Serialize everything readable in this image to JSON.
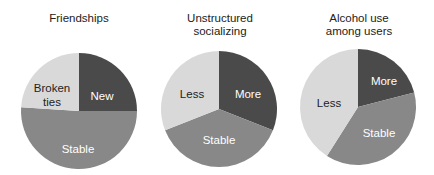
{
  "chart_data": [
    {
      "type": "pie",
      "title": "Friendships",
      "slices": [
        {
          "label": "New",
          "value": 25,
          "color": "#4a4a4a",
          "text_color": "#ffffff"
        },
        {
          "label": "Stable",
          "value": 51,
          "color": "#888888",
          "text_color": "#ffffff"
        },
        {
          "label": "Broken ties",
          "value": 24,
          "color": "#d9d9d9",
          "text_color": "#222222"
        }
      ]
    },
    {
      "type": "pie",
      "title": "Unstructured socializing",
      "slices": [
        {
          "label": "More",
          "value": 31,
          "color": "#4a4a4a",
          "text_color": "#ffffff"
        },
        {
          "label": "Stable",
          "value": 38,
          "color": "#888888",
          "text_color": "#ffffff"
        },
        {
          "label": "Less",
          "value": 31,
          "color": "#d9d9d9",
          "text_color": "#222222"
        }
      ]
    },
    {
      "type": "pie",
      "title": "Alcohol use among users",
      "slices": [
        {
          "label": "More",
          "value": 21,
          "color": "#4a4a4a",
          "text_color": "#ffffff"
        },
        {
          "label": "Stable",
          "value": 38,
          "color": "#888888",
          "text_color": "#ffffff"
        },
        {
          "label": "Less",
          "value": 41,
          "color": "#d9d9d9",
          "text_color": "#222222"
        }
      ]
    }
  ],
  "titles": {
    "c0": [
      "Friendships"
    ],
    "c1": [
      "Unstructured",
      "socializing"
    ],
    "c2": [
      "Alcohol use",
      "among users"
    ]
  },
  "labels": {
    "c0": {
      "new": "New",
      "stable": "Stable",
      "broken_1": "Broken",
      "broken_2": "ties"
    },
    "c1": {
      "more": "More",
      "stable": "Stable",
      "less": "Less"
    },
    "c2": {
      "more": "More",
      "stable": "Stable",
      "less": "Less"
    }
  }
}
